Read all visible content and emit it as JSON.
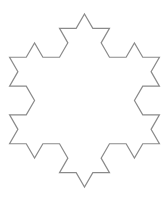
{
  "figure": {
    "iterations": 2,
    "center": [
      84.5,
      100.5
    ],
    "radius": 86.5,
    "stroke_color": "#8a8a8a",
    "stroke_width": 1.2,
    "fill_color": "#ffffff",
    "background": "#ffffff"
  }
}
